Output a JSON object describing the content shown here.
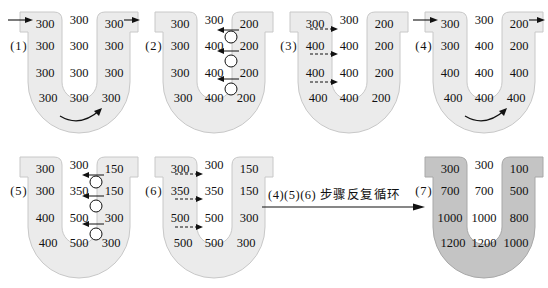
{
  "colors": {
    "tube_light": "#ebebeb",
    "tube_light_stroke": "#c8c8c8",
    "tube_dark": "#c4c4c4",
    "tube_dark_stroke": "#a8a8a8",
    "arrow": "#111111"
  },
  "panels": [
    {
      "label": "(1)",
      "left": [
        "300",
        "300",
        "300",
        "300"
      ],
      "middle": [
        "300",
        "300",
        "300",
        "300"
      ],
      "right": [
        "300",
        "300",
        "300",
        "300"
      ],
      "inflow_arrow": true,
      "outflow_arrow": true,
      "bottom_flow_arrow": true,
      "active_transport": false,
      "passive_diffusion": false,
      "shade": "light"
    },
    {
      "label": "(2)",
      "left": [
        "300",
        "300",
        "300",
        "300"
      ],
      "middle": [
        "300",
        "400",
        "400",
        "400"
      ],
      "right": [
        "200",
        "200",
        "200",
        "200"
      ],
      "inflow_arrow": false,
      "outflow_arrow": false,
      "bottom_flow_arrow": false,
      "active_transport": true,
      "passive_diffusion": false,
      "shade": "light"
    },
    {
      "label": "(3)",
      "left": [
        "300",
        "400",
        "400",
        "400"
      ],
      "middle": [
        "300",
        "400",
        "400",
        "400"
      ],
      "right": [
        "200",
        "200",
        "200",
        "200"
      ],
      "inflow_arrow": false,
      "outflow_arrow": false,
      "bottom_flow_arrow": false,
      "active_transport": false,
      "passive_diffusion": true,
      "shade": "light"
    },
    {
      "label": "(4)",
      "left": [
        "300",
        "300",
        "400",
        "400"
      ],
      "middle": [
        "300",
        "400",
        "400",
        "400"
      ],
      "right": [
        "200",
        "200",
        "400",
        "400"
      ],
      "inflow_arrow": true,
      "outflow_arrow": true,
      "bottom_flow_arrow": true,
      "active_transport": false,
      "passive_diffusion": false,
      "shade": "light"
    },
    {
      "label": "(5)",
      "left": [
        "300",
        "300",
        "400",
        "400"
      ],
      "middle": [
        "300",
        "350",
        "500",
        "500"
      ],
      "right": [
        "150",
        "150",
        "300",
        "300"
      ],
      "inflow_arrow": false,
      "outflow_arrow": false,
      "bottom_flow_arrow": false,
      "active_transport": true,
      "passive_diffusion": false,
      "shade": "light"
    },
    {
      "label": "(6)",
      "left": [
        "300",
        "350",
        "500",
        "500"
      ],
      "middle": [
        "300",
        "350",
        "500",
        "500"
      ],
      "right": [
        "150",
        "150",
        "300",
        "300"
      ],
      "inflow_arrow": false,
      "outflow_arrow": false,
      "bottom_flow_arrow": false,
      "active_transport": false,
      "passive_diffusion": true,
      "shade": "light"
    },
    {
      "label": "(7)",
      "left": [
        "300",
        "700",
        "1000",
        "1200"
      ],
      "middle": [
        "300",
        "700",
        "1000",
        "1200"
      ],
      "right": [
        "100",
        "500",
        "800",
        "1000"
      ],
      "inflow_arrow": false,
      "outflow_arrow": false,
      "bottom_flow_arrow": false,
      "active_transport": false,
      "passive_diffusion": false,
      "shade": "dark"
    }
  ],
  "repeat_caption": "(4)(5)(6) 步骤反复循环"
}
